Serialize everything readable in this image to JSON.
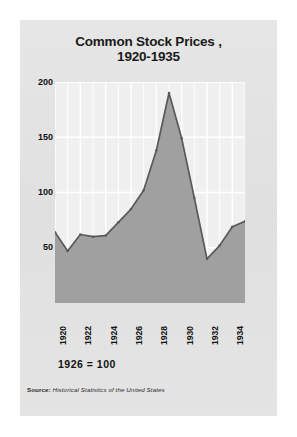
{
  "card": {
    "background_color": "#e3e3e3"
  },
  "title": {
    "line1": "Common Stock Prices ,",
    "line2": "1920-1935"
  },
  "baseline_note": "1926 = 100",
  "source": {
    "label": "Source:",
    "title": " Historical Statistics of the United States"
  },
  "chart_data": {
    "type": "area",
    "title": "Common Stock Prices , 1920-1935",
    "subtitle": "1926 = 100",
    "xlabel": "",
    "ylabel": "",
    "xlim": [
      1920,
      1935
    ],
    "ylim": [
      0,
      200
    ],
    "ytick_labels": [
      "200",
      "150",
      "100",
      "50"
    ],
    "yticks": [
      200,
      150,
      100,
      50
    ],
    "xtick_labels": [
      "1920",
      "1922",
      "1924",
      "1926",
      "1928",
      "1930",
      "1932",
      "1934"
    ],
    "xticks": [
      1920,
      1922,
      1924,
      1926,
      1928,
      1930,
      1932,
      1934
    ],
    "grid": "vertical-and-horizontal-white",
    "legend": "none",
    "area_color": "#a0a0a0",
    "line_color": "#5a5a5a",
    "plot_bg_color": "#f0f0f0",
    "x": [
      1920,
      1921,
      1922,
      1923,
      1924,
      1925,
      1926,
      1927,
      1928,
      1929,
      1930,
      1931,
      1932,
      1933,
      1934,
      1935
    ],
    "values": [
      64,
      47,
      62,
      60,
      61,
      73,
      85,
      102,
      138,
      190,
      149,
      95,
      40,
      52,
      69,
      74
    ],
    "series": [
      {
        "name": "Common Stock Prices",
        "values": [
          64,
          47,
          62,
          60,
          61,
          73,
          85,
          102,
          138,
          190,
          149,
          95,
          40,
          52,
          69,
          74
        ]
      }
    ],
    "annotations": [
      "Peak 190 in 1929",
      "Trough 40 in 1932"
    ]
  }
}
